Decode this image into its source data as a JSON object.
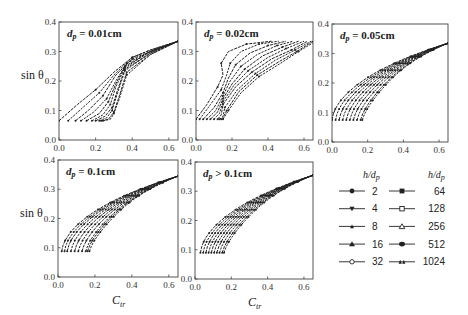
{
  "figure": {
    "ylabel": "sin θ",
    "xlabel": "C_tr",
    "xticks": [
      "0.0",
      "0.2",
      "0.4",
      "0.6"
    ],
    "yticks": [
      "0.0",
      "0.1",
      "0.2",
      "0.3",
      "0.4"
    ],
    "legend_title": "h/d_p",
    "line_color": "#222222"
  },
  "chart_data": [
    {
      "type": "line",
      "title": "dp = 0.01cm",
      "xlabel": "",
      "ylabel": "sin θ",
      "xlim": [
        0,
        0.65
      ],
      "ylim": [
        0,
        0.4
      ],
      "series_desc": "10 curves for h/dp = 2..1024; low-end start x from 0.0 to 0.24 at sinθ≈0.065, converging near (0.65, 0.33)",
      "curves": [
        [
          [
            0.0,
            0.065
          ],
          [
            0.1,
            0.12
          ],
          [
            0.2,
            0.17
          ],
          [
            0.3,
            0.23
          ],
          [
            0.4,
            0.28
          ],
          [
            0.5,
            0.305
          ],
          [
            0.65,
            0.335
          ]
        ],
        [
          [
            0.05,
            0.065
          ],
          [
            0.13,
            0.11
          ],
          [
            0.22,
            0.16
          ],
          [
            0.3,
            0.22
          ],
          [
            0.4,
            0.28
          ],
          [
            0.5,
            0.305
          ],
          [
            0.65,
            0.335
          ]
        ],
        [
          [
            0.09,
            0.065
          ],
          [
            0.16,
            0.1
          ],
          [
            0.24,
            0.15
          ],
          [
            0.31,
            0.22
          ],
          [
            0.4,
            0.275
          ],
          [
            0.5,
            0.3
          ],
          [
            0.65,
            0.335
          ]
        ],
        [
          [
            0.12,
            0.065
          ],
          [
            0.19,
            0.095
          ],
          [
            0.26,
            0.14
          ],
          [
            0.31,
            0.2
          ],
          [
            0.37,
            0.26
          ],
          [
            0.5,
            0.3
          ],
          [
            0.65,
            0.335
          ]
        ],
        [
          [
            0.15,
            0.065
          ],
          [
            0.22,
            0.09
          ],
          [
            0.27,
            0.13
          ],
          [
            0.31,
            0.19
          ],
          [
            0.36,
            0.25
          ],
          [
            0.5,
            0.3
          ],
          [
            0.65,
            0.335
          ]
        ],
        [
          [
            0.18,
            0.065
          ],
          [
            0.24,
            0.085
          ],
          [
            0.28,
            0.12
          ],
          [
            0.31,
            0.18
          ],
          [
            0.36,
            0.245
          ],
          [
            0.5,
            0.3
          ],
          [
            0.65,
            0.335
          ]
        ],
        [
          [
            0.2,
            0.065
          ],
          [
            0.25,
            0.08
          ],
          [
            0.29,
            0.11
          ],
          [
            0.32,
            0.17
          ],
          [
            0.36,
            0.24
          ],
          [
            0.5,
            0.295
          ],
          [
            0.65,
            0.335
          ]
        ],
        [
          [
            0.22,
            0.065
          ],
          [
            0.26,
            0.075
          ],
          [
            0.29,
            0.1
          ],
          [
            0.32,
            0.16
          ],
          [
            0.36,
            0.235
          ],
          [
            0.5,
            0.295
          ],
          [
            0.65,
            0.335
          ]
        ],
        [
          [
            0.23,
            0.065
          ],
          [
            0.27,
            0.07
          ],
          [
            0.3,
            0.095
          ],
          [
            0.33,
            0.15
          ],
          [
            0.37,
            0.23
          ],
          [
            0.5,
            0.29
          ],
          [
            0.65,
            0.335
          ]
        ],
        [
          [
            0.24,
            0.065
          ],
          [
            0.28,
            0.07
          ],
          [
            0.3,
            0.09
          ],
          [
            0.33,
            0.14
          ],
          [
            0.37,
            0.22
          ],
          [
            0.5,
            0.29
          ],
          [
            0.65,
            0.335
          ]
        ]
      ]
    },
    {
      "type": "line",
      "title": "dp = 0.02cm",
      "xlim": [
        0,
        0.65
      ],
      "ylim": [
        0,
        0.4
      ],
      "series_desc": "curves start x 0.0..0.15 at sinθ≈0.068; ends spread x 0.42..0.65 at sinθ≈0.335",
      "curves": [
        [
          [
            0.0,
            0.07
          ],
          [
            0.06,
            0.12
          ],
          [
            0.12,
            0.18
          ],
          [
            0.15,
            0.22
          ],
          [
            0.14,
            0.26
          ],
          [
            0.18,
            0.3
          ],
          [
            0.28,
            0.325
          ],
          [
            0.42,
            0.335
          ]
        ],
        [
          [
            0.02,
            0.07
          ],
          [
            0.08,
            0.12
          ],
          [
            0.14,
            0.17
          ],
          [
            0.17,
            0.22
          ],
          [
            0.19,
            0.26
          ],
          [
            0.25,
            0.3
          ],
          [
            0.35,
            0.325
          ],
          [
            0.46,
            0.335
          ]
        ],
        [
          [
            0.04,
            0.07
          ],
          [
            0.1,
            0.11
          ],
          [
            0.15,
            0.16
          ],
          [
            0.18,
            0.21
          ],
          [
            0.22,
            0.255
          ],
          [
            0.3,
            0.295
          ],
          [
            0.4,
            0.32
          ],
          [
            0.5,
            0.335
          ]
        ],
        [
          [
            0.06,
            0.07
          ],
          [
            0.11,
            0.1
          ],
          [
            0.15,
            0.15
          ],
          [
            0.19,
            0.2
          ],
          [
            0.25,
            0.25
          ],
          [
            0.34,
            0.29
          ],
          [
            0.45,
            0.32
          ],
          [
            0.54,
            0.335
          ]
        ],
        [
          [
            0.08,
            0.07
          ],
          [
            0.12,
            0.095
          ],
          [
            0.15,
            0.14
          ],
          [
            0.2,
            0.19
          ],
          [
            0.27,
            0.24
          ],
          [
            0.37,
            0.285
          ],
          [
            0.48,
            0.315
          ],
          [
            0.57,
            0.335
          ]
        ],
        [
          [
            0.1,
            0.07
          ],
          [
            0.13,
            0.09
          ],
          [
            0.15,
            0.13
          ],
          [
            0.21,
            0.185
          ],
          [
            0.29,
            0.235
          ],
          [
            0.4,
            0.28
          ],
          [
            0.5,
            0.31
          ],
          [
            0.6,
            0.335
          ]
        ],
        [
          [
            0.12,
            0.07
          ],
          [
            0.14,
            0.085
          ],
          [
            0.15,
            0.12
          ],
          [
            0.22,
            0.18
          ],
          [
            0.31,
            0.23
          ],
          [
            0.42,
            0.275
          ],
          [
            0.53,
            0.305
          ],
          [
            0.62,
            0.335
          ]
        ],
        [
          [
            0.13,
            0.07
          ],
          [
            0.15,
            0.08
          ],
          [
            0.16,
            0.11
          ],
          [
            0.23,
            0.17
          ],
          [
            0.33,
            0.225
          ],
          [
            0.44,
            0.27
          ],
          [
            0.55,
            0.305
          ],
          [
            0.64,
            0.335
          ]
        ],
        [
          [
            0.14,
            0.07
          ],
          [
            0.15,
            0.075
          ],
          [
            0.17,
            0.1
          ],
          [
            0.24,
            0.165
          ],
          [
            0.34,
            0.22
          ],
          [
            0.46,
            0.265
          ],
          [
            0.56,
            0.3
          ],
          [
            0.65,
            0.335
          ]
        ],
        [
          [
            0.15,
            0.07
          ],
          [
            0.16,
            0.08
          ],
          [
            0.18,
            0.1
          ],
          [
            0.25,
            0.16
          ],
          [
            0.35,
            0.215
          ],
          [
            0.47,
            0.26
          ],
          [
            0.57,
            0.3
          ],
          [
            0.65,
            0.33
          ]
        ]
      ]
    },
    {
      "type": "line",
      "title": "dp = 0.05cm",
      "xlim": [
        0,
        0.65
      ],
      "ylim": [
        0,
        0.4
      ],
      "series_desc": "curves start x 0.0..0.17 at sinθ≈0.075, converge near (0.65, 0.335)",
      "start_x": [
        0.0,
        0.02,
        0.04,
        0.06,
        0.08,
        0.1,
        0.12,
        0.14,
        0.16,
        0.17
      ],
      "start_y": 0.075,
      "end": [
        0.65,
        0.335
      ]
    },
    {
      "type": "line",
      "title": "dp = 0.1cm",
      "xlabel": "C_tr",
      "ylabel": "sin θ",
      "xlim": [
        0,
        0.65
      ],
      "ylim": [
        0,
        0.4
      ],
      "series_desc": "curves start x 0.02..0.17 at sinθ≈0.088, converge near (0.65, 0.345)",
      "start_x": [
        0.02,
        0.035,
        0.05,
        0.07,
        0.09,
        0.11,
        0.13,
        0.15,
        0.16,
        0.17
      ],
      "start_y": 0.088,
      "end": [
        0.65,
        0.345
      ]
    },
    {
      "type": "line",
      "title": "dp > 0.1cm",
      "xlabel": "C_tr",
      "xlim": [
        0,
        0.65
      ],
      "ylim": [
        0,
        0.4
      ],
      "series_desc": "curves start x 0.03..0.16 at sinθ≈0.09, converge near (0.65, 0.355)",
      "start_x": [
        0.03,
        0.045,
        0.06,
        0.075,
        0.09,
        0.105,
        0.12,
        0.135,
        0.15,
        0.16
      ],
      "start_y": 0.09,
      "end": [
        0.65,
        0.355
      ]
    }
  ],
  "legend": {
    "title_left": "h/d_p",
    "title_right": "h/d_p",
    "entries": [
      {
        "label": "2",
        "marker": "filled-circle"
      },
      {
        "label": "4",
        "marker": "filled-triangle-down"
      },
      {
        "label": "8",
        "marker": "small-filled-triangle-up"
      },
      {
        "label": "16",
        "marker": "filled-triangle-up"
      },
      {
        "label": "32",
        "marker": "open-circle"
      },
      {
        "label": "64",
        "marker": "filled-square"
      },
      {
        "label": "128",
        "marker": "open-square"
      },
      {
        "label": "256",
        "marker": "open-triangle-up"
      },
      {
        "label": "512",
        "marker": "filled-hexagon"
      },
      {
        "label": "1024",
        "marker": "double-triangle"
      }
    ]
  }
}
